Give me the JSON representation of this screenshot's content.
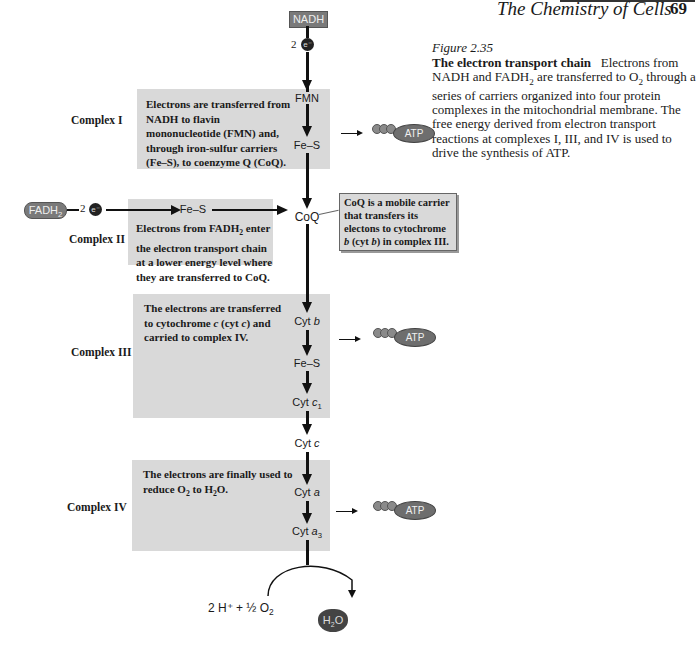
{
  "header": {
    "running_title": "The Chemistry of Cells",
    "page_number": "69"
  },
  "figure": {
    "label": "Figure 2.35",
    "caption_title": "The electron transport chain",
    "caption_body_1": "Electrons from NADH and FADH",
    "caption_body_2": " are transferred to O",
    "caption_body_3": " through a series of carriers organized into four protein complexes in the mitochondrial membrane. The free energy derived from electron transport reactions at complexes I, III, and IV is used to drive the synthesis of ATP.",
    "sub2": "2"
  },
  "inputs": {
    "nadh": "NADH",
    "fadh": "FADH",
    "fadh_sub": "2",
    "electron_count": "2",
    "electron_symbol": "e⁻"
  },
  "complexes": [
    {
      "label": "Complex I",
      "description": "Electrons are transferred from NADH to flavin mononucleotide (FMN) and, through iron-sulfur carriers (Fe–S), to coenzyme Q (CoQ).",
      "carriers": [
        "FMN",
        "Fe–S"
      ],
      "produces_atp": true
    },
    {
      "label": "Complex II",
      "description_a": "Electrons from FADH",
      "description_b": " enter the electron transport chain at a lower energy level where they are transferred to CoQ.",
      "carriers": [
        "Fe–S"
      ],
      "produces_atp": false
    },
    {
      "label": "Complex III",
      "description": "The electrons are transferred to cytochrome c (cyt c) and carried to complex IV.",
      "carriers": [
        "Cyt b",
        "Fe–S",
        "Cyt c1"
      ],
      "produces_atp": true
    },
    {
      "label": "Complex IV",
      "description_a": "The electrons are finally used to reduce O",
      "description_b": " to H",
      "description_c": "O.",
      "carriers": [
        "Cyt a",
        "Cyt a3"
      ],
      "produces_atp": true
    }
  ],
  "mobile_carriers": {
    "coq": "CoQ",
    "cyt_c": "Cyt c"
  },
  "callout": {
    "text_a": "CoQ is a mobile carrier that transfers its electons to cytochrome ",
    "b1": "b",
    "text_b": " (cyt ",
    "b2": "b",
    "text_c": ") in complex III."
  },
  "atp": {
    "label": "ATP"
  },
  "final": {
    "reactants": "2 H⁺ + ½ O",
    "reactants_sub": "2",
    "product": "H",
    "product_sub": "2",
    "product_tail": "O"
  },
  "colors": {
    "box_gray": "#d9d9d9",
    "pill_gray": "#7a7a7a",
    "atp_gray": "#6e6e6e",
    "arrow": "#111111"
  }
}
